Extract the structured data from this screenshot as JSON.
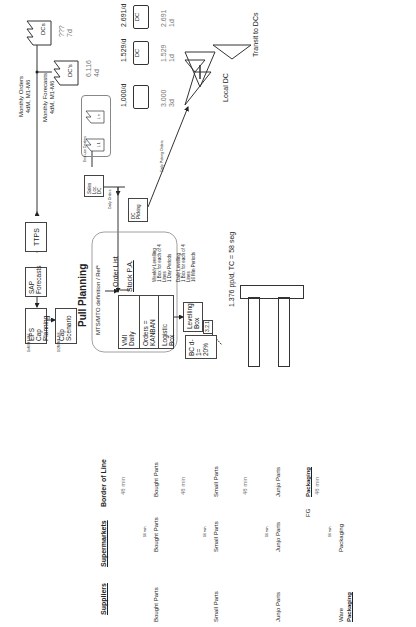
{
  "title": "Pull Planning",
  "info_flow": {
    "monthly_orders": "Monthly Orders",
    "monthly_orders_detail": "4dM, M1-M6",
    "monthly_forecasts": "Monthly Forecasts",
    "monthly_forecasts_detail": "4dM, M1-M6",
    "dcs_label": "DCs",
    "dcs_qty": "???",
    "dcs_days": "7d",
    "dcs2_label": "DC's",
    "dcs2_qty": "6.116",
    "dcs2_days": "4d",
    "ttps": "TTPS",
    "sap_line1": "SAP",
    "sap_line2": "Forecasts",
    "eps_line1": "EPS",
    "eps_line2": "Cap Planning",
    "eps_note": "1xM M1-M6",
    "cap_line1": "Cap",
    "cap_line2": "Scenario",
    "cap_note": "1/2M M1-M6"
  },
  "sales": {
    "customers_label": "End-use Dealers",
    "l1": "L 1",
    "ln": "L n",
    "sales_box_line1": "Sales",
    "sales_box_line2": "Loc. DC",
    "daily_orders": "Daily Orders",
    "dc_picking_line1": "DC",
    "dc_picking_line2": "Picking",
    "daily_picking_orders": "Daily Picking Orders"
  },
  "shipments": [
    {
      "rate": "1,000/d",
      "freq": "Daily",
      "qty": "3.000",
      "days": "3d"
    },
    {
      "rate": "1.529/d",
      "freq": "Daily",
      "qty": "1.529",
      "days": "1d",
      "truck_label": "DC"
    },
    {
      "rate": "2.691/d",
      "freq": "Daily",
      "qty": "2.691",
      "days": "1d",
      "truck_label": "DC"
    }
  ],
  "inventories": {
    "local_dc": "Local DC",
    "transit_to_dcs": "Transit to DCs",
    "small_inv_label": "WIP",
    "small_inv_1": "Kitting",
    "small_inv_2": "Stock"
  },
  "planning_block": {
    "mts_label": "MTS/MTO definition / Ref*",
    "order_list": "Order List",
    "stock_pa": "Stock P.A.",
    "vmi_line1": "VMI",
    "vmi_line2": "Daily",
    "orders_line1": "Orders =",
    "orders_line2": "KANBAN",
    "logistic_line1": "Logistic",
    "logistic_line2": "Box",
    "weekly_levelling": [
      "Weekly Levelling",
      "1 Box for each of 4",
      "Lines",
      "1 Day Periods"
    ],
    "daily_levelling": [
      "Daily Levelling",
      "1 Box for each of 4",
      "Lines",
      "16 Min Periods"
    ],
    "levelling_line1": "Levelling",
    "levelling_line2": "Box",
    "kanban_321": "3.2.1",
    "bc_line1": "BC d-1=",
    "bc_line2": "20%"
  },
  "line": {
    "takt": "1.376 pp/d, TC = 58 seg"
  },
  "columns": {
    "suppliers": "Suppliers",
    "supermarkets": "Supermarkets",
    "border_of_line": "Border of Line"
  },
  "loops": [
    {
      "supplier_label": [
        "Log",
        "Bought Parts"
      ],
      "supermarket_label": [
        "Log",
        "Bought Parts"
      ],
      "bol_label": "Bought Parts",
      "cycle": "16 min",
      "time": "48 min",
      "card": "3.2"
    },
    {
      "supplier_label": [
        "Kanban",
        "Small Parts"
      ],
      "supermarket_label": [
        "Kanban",
        "Small Parts"
      ],
      "bol_label": [
        "Kanban",
        "Small Parts"
      ],
      "cycle": "16 min",
      "time": "48 min"
    },
    {
      "supplier_label": [
        "Junjo Parts"
      ],
      "supermarket_label": [
        "Junjo Parts"
      ],
      "bol_label": "Junjo Parts",
      "cycle": "16 min",
      "time": "48 min",
      "card": "3.2.1",
      "bc": "BC d-1"
    },
    {
      "supplier_label": [
        "Ware",
        "Packaging"
      ],
      "supermarket_label": [
        "Packaging"
      ],
      "bol_label": "Packaging",
      "cycle": "16 min",
      "time": "48 min",
      "card": "3.2.1",
      "fg": "FG",
      "bc": "BC d-1",
      "truck_label": "1.6"
    }
  ]
}
